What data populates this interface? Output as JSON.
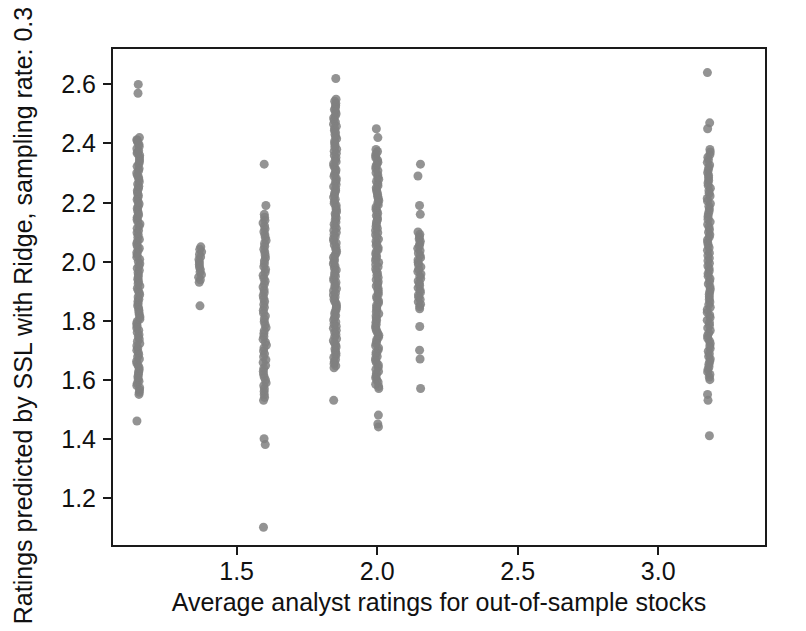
{
  "figure": {
    "background_color": "#ffffff",
    "frame_color": "#1a1a1a",
    "marker_color": "#808080",
    "text_color": "#111111"
  },
  "axes": {
    "x_title": "Average analyst ratings for out-of-sample stocks",
    "y_title": "Ratings predicted by SSL with Ridge, sampling rate: 0.3",
    "x_ticks": [
      "1.5",
      "2.0",
      "2.5",
      "3.0"
    ],
    "y_ticks": [
      "1.2",
      "1.4",
      "1.6",
      "1.8",
      "2.0",
      "2.2",
      "2.4",
      "2.6"
    ]
  },
  "chart_data": {
    "type": "scatter",
    "title": "",
    "xlabel": "Average analyst ratings for out-of-sample stocks",
    "ylabel": "Ratings predicted by SSL with Ridge, sampling rate: 0.3",
    "xlim": [
      1.06,
      3.38
    ],
    "ylim": [
      1.04,
      2.72
    ],
    "x_ticks": [
      1.5,
      2.0,
      2.5,
      3.0
    ],
    "y_ticks": [
      1.2,
      1.4,
      1.6,
      1.8,
      2.0,
      2.2,
      2.4,
      2.6
    ],
    "grid": false,
    "legend": null,
    "marker": {
      "shape": "circle",
      "color": "#808080",
      "size": 9,
      "opacity": 0.85
    },
    "columns": [
      {
        "x": 1.15,
        "n_points": 122,
        "y_min": 1.46,
        "y_max": 2.6,
        "dense_band": [
          1.55,
          2.42
        ],
        "outliers": [
          2.6,
          2.57,
          2.41,
          2.37,
          1.46
        ]
      },
      {
        "x": 1.37,
        "n_points": 16,
        "y_min": 1.85,
        "y_max": 2.05,
        "dense_band": [
          1.93,
          2.05
        ],
        "outliers": [
          1.85
        ]
      },
      {
        "x": 1.6,
        "n_points": 70,
        "y_min": 1.1,
        "y_max": 2.33,
        "dense_band": [
          1.53,
          2.16
        ],
        "outliers": [
          2.33,
          2.19,
          1.4,
          1.38,
          1.1
        ]
      },
      {
        "x": 1.85,
        "n_points": 132,
        "y_min": 1.53,
        "y_max": 2.62,
        "dense_band": [
          1.64,
          2.55
        ],
        "outliers": [
          2.62,
          1.53
        ]
      },
      {
        "x": 2.0,
        "n_points": 118,
        "y_min": 1.44,
        "y_max": 2.45,
        "dense_band": [
          1.57,
          2.38
        ],
        "outliers": [
          2.45,
          2.42,
          1.48,
          1.45,
          1.44
        ]
      },
      {
        "x": 2.15,
        "n_points": 42,
        "y_min": 1.57,
        "y_max": 2.33,
        "dense_band": [
          1.84,
          2.1
        ],
        "outliers": [
          2.33,
          2.29,
          2.19,
          2.16,
          1.78,
          1.7,
          1.67,
          1.57
        ]
      },
      {
        "x": 3.18,
        "n_points": 96,
        "y_min": 1.41,
        "y_max": 2.64,
        "dense_band": [
          1.6,
          2.38
        ],
        "outliers": [
          2.64,
          2.47,
          2.45,
          1.55,
          1.53,
          1.41
        ]
      }
    ]
  }
}
